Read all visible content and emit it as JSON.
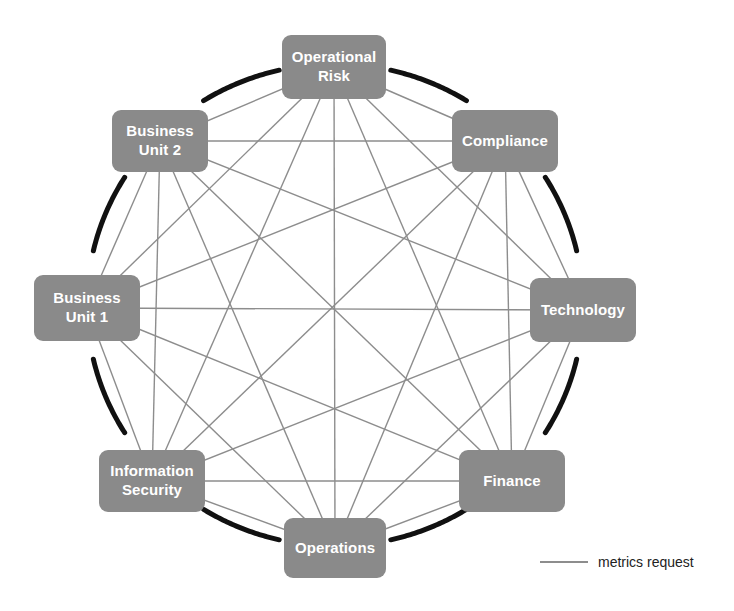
{
  "diagram": {
    "colors": {
      "node_fill": "#8a8a8a",
      "node_text": "#ffffff",
      "ring_arc": "#111111",
      "link_line": "#8d8d8d",
      "background": "#ffffff"
    },
    "nodes": [
      {
        "id": "operational-risk",
        "label": "Operational\nRisk",
        "cx": 334,
        "cy": 67,
        "w": 104,
        "h": 64
      },
      {
        "id": "compliance",
        "label": "Compliance",
        "cx": 505,
        "cy": 141,
        "w": 106,
        "h": 62
      },
      {
        "id": "technology",
        "label": "Technology",
        "cx": 583,
        "cy": 310,
        "w": 106,
        "h": 64
      },
      {
        "id": "finance",
        "label": "Finance",
        "cx": 512,
        "cy": 481,
        "w": 106,
        "h": 62
      },
      {
        "id": "operations",
        "label": "Operations",
        "cx": 335,
        "cy": 548,
        "w": 102,
        "h": 60
      },
      {
        "id": "information-security",
        "label": "Information\nSecurity",
        "cx": 152,
        "cy": 481,
        "w": 106,
        "h": 62
      },
      {
        "id": "business-unit-1",
        "label": "Business\nUnit 1",
        "cx": 87,
        "cy": 308,
        "w": 106,
        "h": 66
      },
      {
        "id": "business-unit-2",
        "label": "Business\nUnit 2",
        "cx": 160,
        "cy": 141,
        "w": 96,
        "h": 62
      }
    ],
    "ring": {
      "cx": 335,
      "cy": 305,
      "rx": 248,
      "ry": 241,
      "arc_count": 8,
      "arc_gap_degrees": 26,
      "stroke_width": 5
    },
    "links": {
      "description": "complete graph: every node connected to every other node",
      "style": "solid",
      "stroke_width": 1.4,
      "pairs": [
        [
          "operational-risk",
          "compliance"
        ],
        [
          "operational-risk",
          "technology"
        ],
        [
          "operational-risk",
          "finance"
        ],
        [
          "operational-risk",
          "operations"
        ],
        [
          "operational-risk",
          "information-security"
        ],
        [
          "operational-risk",
          "business-unit-1"
        ],
        [
          "operational-risk",
          "business-unit-2"
        ],
        [
          "compliance",
          "technology"
        ],
        [
          "compliance",
          "finance"
        ],
        [
          "compliance",
          "operations"
        ],
        [
          "compliance",
          "information-security"
        ],
        [
          "compliance",
          "business-unit-1"
        ],
        [
          "compliance",
          "business-unit-2"
        ],
        [
          "technology",
          "finance"
        ],
        [
          "technology",
          "operations"
        ],
        [
          "technology",
          "information-security"
        ],
        [
          "technology",
          "business-unit-1"
        ],
        [
          "technology",
          "business-unit-2"
        ],
        [
          "finance",
          "operations"
        ],
        [
          "finance",
          "information-security"
        ],
        [
          "finance",
          "business-unit-1"
        ],
        [
          "finance",
          "business-unit-2"
        ],
        [
          "operations",
          "information-security"
        ],
        [
          "operations",
          "business-unit-1"
        ],
        [
          "operations",
          "business-unit-2"
        ],
        [
          "information-security",
          "business-unit-1"
        ],
        [
          "information-security",
          "business-unit-2"
        ],
        [
          "business-unit-1",
          "business-unit-2"
        ]
      ]
    }
  },
  "legend": {
    "label": "metrics request"
  }
}
